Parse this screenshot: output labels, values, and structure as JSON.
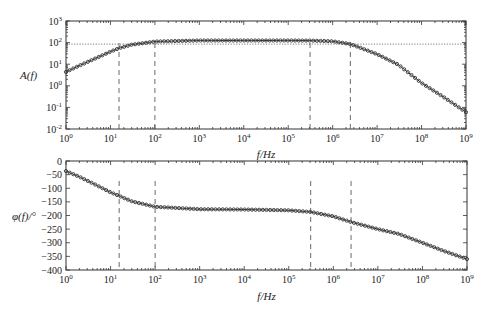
{
  "chart_data": [
    {
      "type": "line",
      "title": "",
      "xlabel": "f/Hz",
      "ylabel": "A(f)",
      "xscale": "log",
      "yscale": "log",
      "xlim": [
        1,
        1000000000
      ],
      "ylim": [
        0.01,
        1000
      ],
      "xticks": [
        1,
        10,
        100,
        1000,
        10000,
        100000,
        1000000,
        10000000,
        100000000,
        1000000000
      ],
      "xtick_labels": [
        "10^0",
        "10^1",
        "10^2",
        "10^3",
        "10^4",
        "10^5",
        "10^6",
        "10^7",
        "10^8",
        "10^9"
      ],
      "yticks": [
        0.01,
        0.1,
        1,
        10,
        100,
        1000
      ],
      "ytick_labels": [
        "10^-2",
        "10^-1",
        "10^0",
        "10^1",
        "10^2",
        "10^3"
      ],
      "grid": false,
      "legend": "none",
      "series": [
        {
          "name": "A(f)",
          "marker": "circle",
          "x": [
            1,
            2,
            5,
            10,
            15.6,
            30,
            100,
            1000,
            10000,
            100000,
            310000,
            1000000,
            2500000,
            10000000,
            30000000,
            100000000,
            300000000,
            1000000000
          ],
          "values": [
            4.4,
            8.6,
            20,
            38,
            55,
            80,
            112,
            125,
            125,
            125,
            124,
            115,
            86,
            29,
            9.5,
            1.35,
            0.32,
            0.06
          ]
        }
      ],
      "reference_lines": {
        "horizontal_dotted": [
          85
        ],
        "vertical_dashed": [
          15.6,
          100,
          310000,
          2500000
        ]
      }
    },
    {
      "type": "line",
      "title": "",
      "xlabel": "f/Hz",
      "ylabel": "φ(f)/°",
      "xscale": "log",
      "yscale": "linear",
      "xlim": [
        1,
        1000000000
      ],
      "ylim": [
        -400,
        0
      ],
      "xticks": [
        1,
        10,
        100,
        1000,
        10000,
        100000,
        1000000,
        10000000,
        100000000,
        1000000000
      ],
      "xtick_labels": [
        "10^0",
        "10^1",
        "10^2",
        "10^3",
        "10^4",
        "10^5",
        "10^6",
        "10^7",
        "10^8",
        "10^9"
      ],
      "yticks": [
        0,
        -50,
        -100,
        -150,
        -200,
        -250,
        -300,
        -350,
        -400
      ],
      "ytick_labels": [
        "0",
        "−50",
        "−100",
        "−150",
        "−200",
        "−250",
        "−300",
        "−350",
        "−400"
      ],
      "grid": false,
      "legend": "none",
      "series": [
        {
          "name": "φ(f)",
          "marker": "circle",
          "x": [
            1,
            2,
            5,
            10,
            15.6,
            30,
            100,
            1000,
            10000,
            100000,
            310000,
            1000000,
            2500000,
            10000000,
            30000000,
            100000000,
            300000000,
            1000000000
          ],
          "values": [
            -37,
            -58,
            -90,
            -115,
            -128,
            -148,
            -168,
            -177,
            -178,
            -181,
            -187,
            -203,
            -224,
            -250,
            -268,
            -300,
            -330,
            -360
          ]
        }
      ],
      "reference_lines": {
        "vertical_dashed": [
          15.6,
          100,
          310000,
          2500000
        ]
      }
    }
  ]
}
